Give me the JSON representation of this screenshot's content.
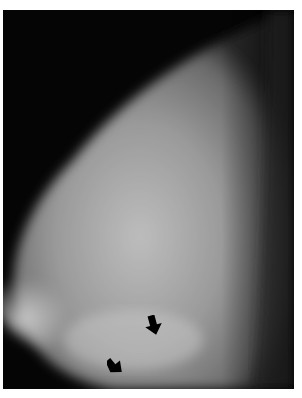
{
  "image": {
    "type": "mammogram",
    "description": "Grayscale mammographic view of breast tissue with two black arrow markers",
    "background_color": "#050505",
    "border_color": "#ffffff"
  },
  "annotations": [
    {
      "type": "arrow",
      "direction": "down",
      "x": 153,
      "y": 323
    },
    {
      "type": "arrow",
      "direction": "down-right",
      "x": 116,
      "y": 364
    }
  ]
}
